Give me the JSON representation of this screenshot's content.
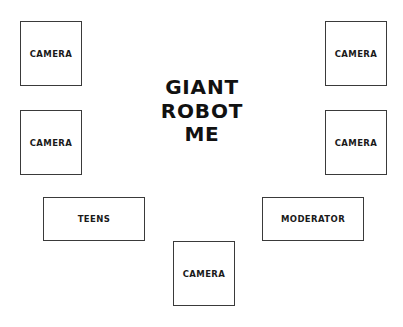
{
  "diagram": {
    "title_lines": [
      "GIANT",
      "ROBOT",
      "ME"
    ],
    "nodes": {
      "camera_top_left": "CAMERA",
      "camera_mid_left": "CAMERA",
      "camera_top_right": "CAMERA",
      "camera_mid_right": "CAMERA",
      "camera_bottom": "CAMERA",
      "teens": "TEENS",
      "moderator": "MODERATOR"
    },
    "colors": {
      "background": "#ffffff",
      "border": "#3a3a3a",
      "text": "#1a1a1a"
    }
  }
}
